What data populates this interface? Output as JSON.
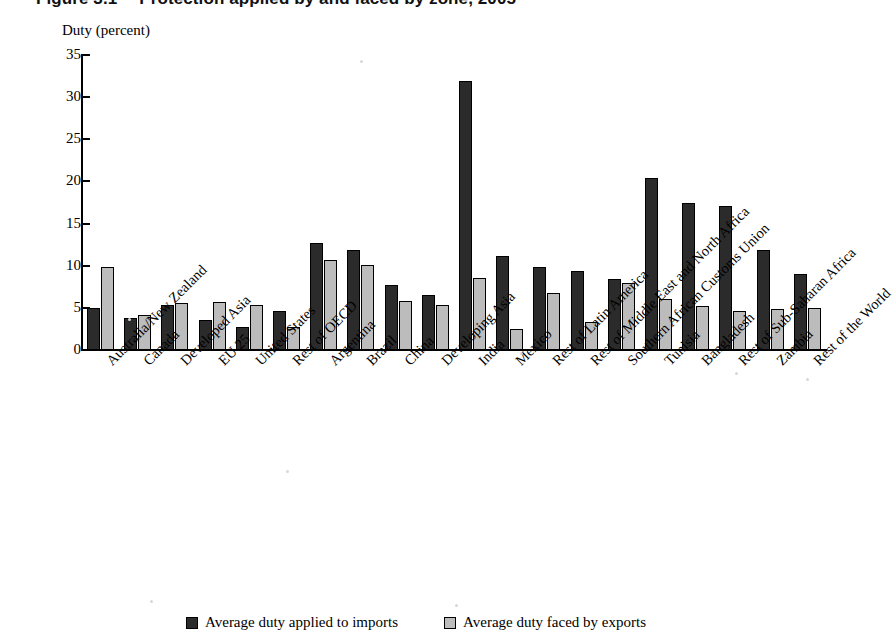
{
  "figure": {
    "number": "Figure 3.1",
    "title": "Protection applied by and faced by zone, 2005"
  },
  "chart_data": {
    "type": "bar",
    "title": "Protection applied by and faced by zone, 2005",
    "xlabel": "",
    "ylabel": "Duty (percent)",
    "ylim": [
      0,
      35
    ],
    "yticks": [
      0,
      5,
      10,
      15,
      20,
      25,
      30,
      35
    ],
    "grid": false,
    "legend_position": "bottom",
    "categories": [
      "Australia/New Zealand",
      "Canada",
      "Developed Asia",
      "EU 25",
      "United States",
      "Rest of OECD",
      "Argentina",
      "Brazil",
      "China",
      "Developing Asia",
      "India",
      "Mexico",
      "Rest of Latin America",
      "Rest of Middle East and North Africa",
      "Southern African Customs Union",
      "Tunisia",
      "Bangladesh",
      "Rest of Sub-Saharan Africa",
      "Zambia",
      "Rest of the World"
    ],
    "series": [
      {
        "name": "Average duty applied to imports",
        "color": "#2b2b2b",
        "values": [
          5.0,
          3.8,
          5.3,
          3.6,
          2.7,
          4.6,
          12.7,
          11.9,
          7.7,
          6.5,
          31.9,
          11.1,
          9.8,
          9.4,
          8.4,
          20.4,
          17.5,
          17.1,
          11.9,
          9.0
        ]
      },
      {
        "name": "Average duty faced by exports",
        "color": "#bcbcbc",
        "values": [
          9.9,
          4.2,
          5.6,
          5.7,
          5.4,
          2.7,
          10.7,
          10.1,
          5.8,
          5.3,
          8.5,
          2.5,
          6.8,
          3.3,
          8.0,
          6.1,
          5.2,
          4.6,
          4.9,
          5.0
        ]
      }
    ]
  },
  "legend": {
    "items": [
      {
        "label": "Average duty applied to imports",
        "color": "#2b2b2b"
      },
      {
        "label": "Average duty faced by exports",
        "color": "#bcbcbc"
      }
    ]
  }
}
